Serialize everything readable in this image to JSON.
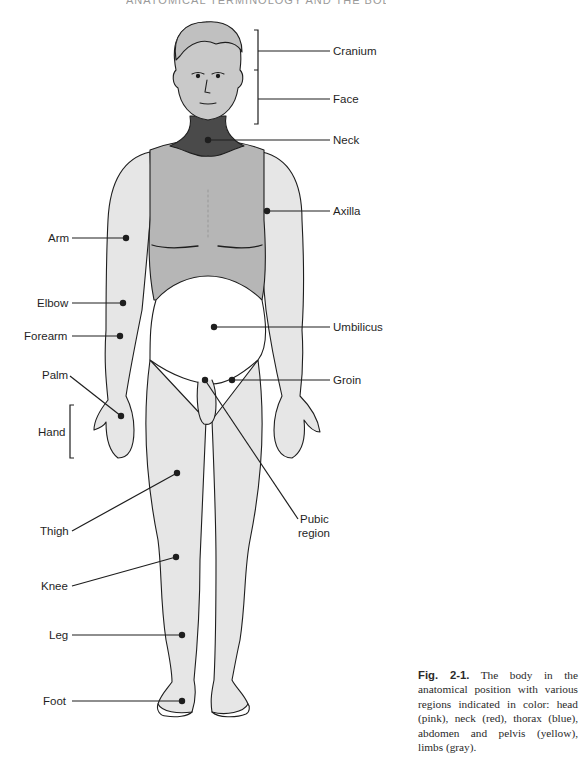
{
  "running_head": "ANATOMICAL TERMINOLOGY AND THE BODY",
  "figure": {
    "region_colors": {
      "head": "#c9c9c9",
      "neck": "#4a4a4a",
      "thorax": "#b6b6b6",
      "abdomen_pelvis": "#ffffff",
      "limbs": "#e6e6e6",
      "outline": "#1e1e1e"
    },
    "labels": {
      "cranium": "Cranium",
      "face": "Face",
      "neck": "Neck",
      "axilla": "Axilla",
      "arm": "Arm",
      "elbow": "Elbow",
      "forearm": "Forearm",
      "umbilicus": "Umbilicus",
      "palm": "Palm",
      "groin": "Groin",
      "hand": "Hand",
      "thigh": "Thigh",
      "pubic_region_line1": "Pubic",
      "pubic_region_line2": "region",
      "knee": "Knee",
      "leg": "Leg",
      "foot": "Foot"
    }
  },
  "caption": {
    "fig_number": "Fig. 2-1.",
    "text": "The body in the anatomical position with various regions indicated in color: head (pink), neck (red), thorax (blue), abdomen and pelvis (yellow), limbs (gray)."
  }
}
